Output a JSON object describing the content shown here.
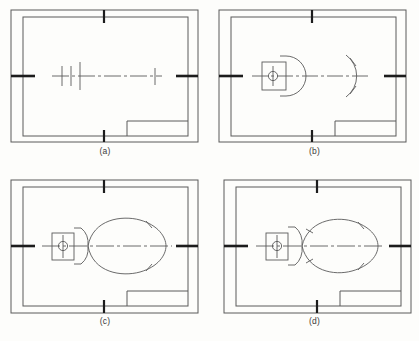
{
  "figure": {
    "background_color": "#fdfdfb",
    "line_color": "#5a5a5a",
    "heavy_line_color": "#1c1c1c",
    "caption_color": "#3a3a3a"
  },
  "panels": [
    {
      "id": "a",
      "caption": "(a)",
      "stage": "centre-line and construction tick marks only",
      "elements": [
        "outer-border",
        "inner-border",
        "title-block",
        "edge-ticks",
        "centre-line",
        "construction-ticks"
      ],
      "construction_tick_count": 4
    },
    {
      "id": "b",
      "caption": "(b)",
      "stage": "base block with bore circle, nose arc and right tangent arc",
      "elements": [
        "outer-border",
        "inner-border",
        "title-block",
        "edge-ticks",
        "centre-line",
        "base-block",
        "bore-circle",
        "nose-arc",
        "tangent-arc"
      ]
    },
    {
      "id": "c",
      "caption": "(c)",
      "stage": "full lens body outline joined to tapered neck",
      "elements": [
        "outer-border",
        "inner-border",
        "title-block",
        "edge-ticks",
        "centre-line",
        "base-block",
        "bore-circle",
        "tapered-neck",
        "lens-body"
      ]
    },
    {
      "id": "d",
      "caption": "(d)",
      "stage": "finished profile with flared neck and trimmed body",
      "elements": [
        "outer-border",
        "inner-border",
        "title-block",
        "edge-ticks",
        "centre-line",
        "base-block",
        "bore-circle",
        "flared-neck",
        "body-outline"
      ]
    }
  ],
  "sheet": {
    "outer_border": "rectangular sheet edge",
    "inner_border": "drawing frame inset from sheet edge",
    "title_block": "rectangle at lower-right of frame",
    "edge_ticks": [
      "top-centre",
      "bottom-centre",
      "left-centre",
      "right-centre"
    ]
  }
}
